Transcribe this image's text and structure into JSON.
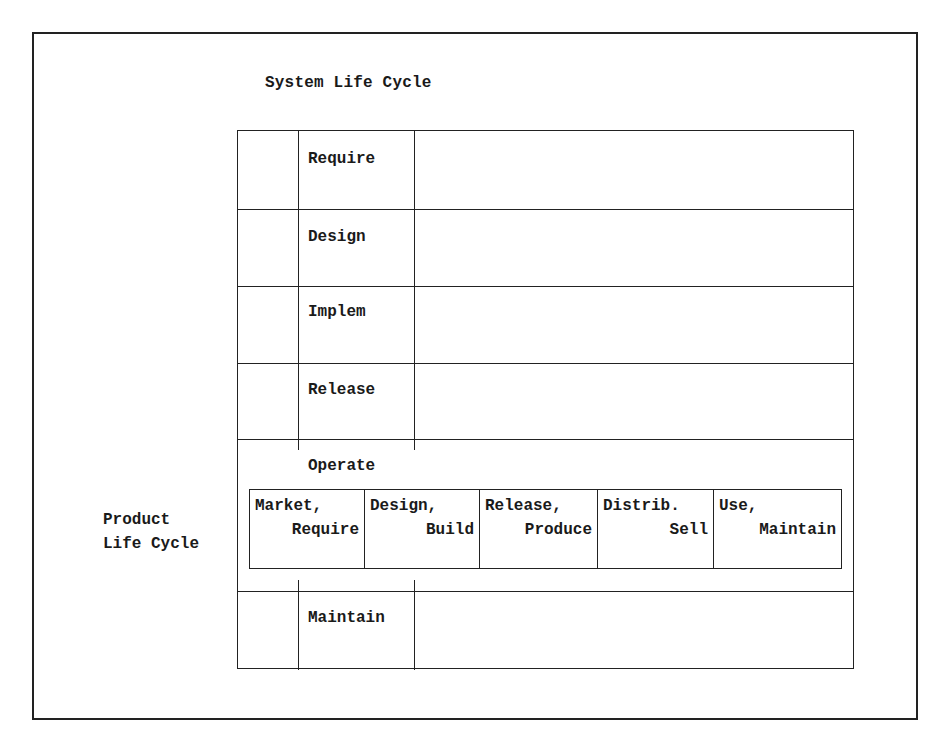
{
  "diagram": {
    "title": "System Life Cycle",
    "system_phases": [
      {
        "label": "Require"
      },
      {
        "label": "Design"
      },
      {
        "label": "Implem"
      },
      {
        "label": "Release"
      },
      {
        "label": "Operate"
      },
      {
        "label": "Maintain"
      }
    ],
    "product_life_cycle": {
      "label_line1": "Product",
      "label_line2": "Life Cycle",
      "stages": [
        {
          "line1": "Market,",
          "line2": "Require"
        },
        {
          "line1": "Design,",
          "line2": "Build"
        },
        {
          "line1": "Release,",
          "line2": "Produce"
        },
        {
          "line1": "Distrib.",
          "line2": "Sell"
        },
        {
          "line1": "Use,",
          "line2": "Maintain"
        }
      ]
    },
    "colors": {
      "line": "#222222",
      "text": "#1a1a1a",
      "background": "#ffffff"
    }
  }
}
